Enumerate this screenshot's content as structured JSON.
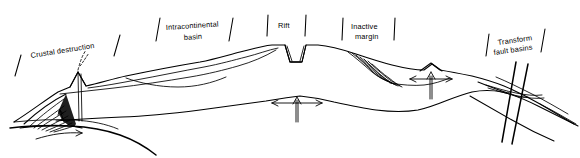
{
  "figure": {
    "background_color": "#ffffff",
    "line_color": "#000000",
    "style": "black line drawing, no shading"
  },
  "labels": {
    "crustal_destruction": "Crustal  destruction",
    "intracontinental_basin_line1": "Intracontinental",
    "intracontinental_basin_line2": "basin",
    "rift": "Rift",
    "inactive_margin_line1": "Inactive",
    "inactive_margin_line2": "margin",
    "transform_line1": "Transform",
    "transform_line2": "fault  basins"
  },
  "zones": [
    {
      "name": "crustal-destruction",
      "label": "Crustal  destruction",
      "bracket": "slanted-ticks",
      "features": [
        "volcano",
        "thrust-fan",
        "subduction-arrow"
      ]
    },
    {
      "name": "intracontinental-basin",
      "label": "Intracontinental basin",
      "bracket": "slanted-ticks",
      "features": [
        "sediment-basin"
      ]
    },
    {
      "name": "rift",
      "label": "Rift",
      "bracket": "vertical-ticks",
      "features": [
        "graben",
        "mantle-upwelling-arrow"
      ]
    },
    {
      "name": "inactive-margin",
      "label": "Inactive margin",
      "bracket": "vertical-ticks",
      "features": [
        "sediment-wedge",
        "mantle-upwelling-arrow"
      ]
    },
    {
      "name": "transform-fault-basins",
      "label": "Transform fault basins",
      "bracket": "slanted-ticks",
      "features": [
        "steep-transform-faults",
        "pull-apart-basin"
      ]
    }
  ],
  "icons": {
    "volcano": "volcano-icon",
    "eruption_plume": "eruption-plume-icon",
    "subduction_arrow": "curved-subduction-arrow-icon",
    "upwelling_rift": "upwelling-arrow-icon",
    "upwelling_margin": "upwelling-arrow-icon",
    "thrust_fan": "thrust-fan-icon",
    "transform_fault": "transform-fault-icon"
  }
}
